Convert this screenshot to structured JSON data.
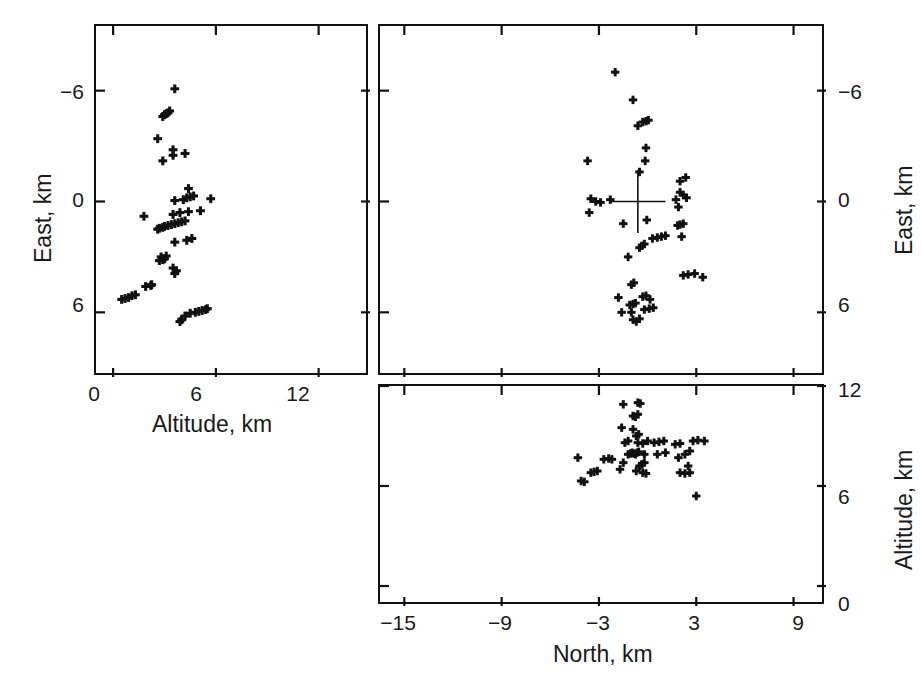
{
  "figure": {
    "background_color": "#ffffff",
    "marker_color": "#111111",
    "axis_color": "#111111"
  },
  "caption": {
    "text": ""
  },
  "chart_data": [
    {
      "id": "east-vs-altitude",
      "type": "scatter",
      "title": "",
      "xlabel": "Altitude, km",
      "ylabel": "East, km",
      "xlim": [
        -1.0,
        15.0
      ],
      "ylim": [
        9.5,
        -9.5
      ],
      "y_inverted": true,
      "xticks": [
        0,
        6,
        12
      ],
      "xticklabels": [
        "0",
        "6",
        "12"
      ],
      "yticks": [
        -6,
        0,
        6
      ],
      "yticklabels": [
        "−6",
        "0",
        "6"
      ],
      "grid": false,
      "legend": "none",
      "marker": "plus",
      "ylabel_side": "left",
      "xlabel_side": "bottom",
      "points": [
        [
          3.9,
          -6.5
        ],
        [
          4.0,
          -6.4
        ],
        [
          4.2,
          -6.2
        ],
        [
          4.5,
          -6.05
        ],
        [
          4.8,
          -6.0
        ],
        [
          5.0,
          -5.95
        ],
        [
          5.2,
          -5.9
        ],
        [
          5.4,
          -5.85
        ],
        [
          5.5,
          -5.8
        ],
        [
          0.5,
          -5.3
        ],
        [
          0.7,
          -5.25
        ],
        [
          0.9,
          -5.2
        ],
        [
          1.1,
          -5.1
        ],
        [
          1.3,
          -5.05
        ],
        [
          1.9,
          -4.6
        ],
        [
          2.2,
          -4.55
        ],
        [
          2.25,
          -4.5
        ],
        [
          3.6,
          -3.9
        ],
        [
          3.7,
          -3.75
        ],
        [
          3.5,
          -3.6
        ],
        [
          2.7,
          -3.2
        ],
        [
          2.9,
          -3.15
        ],
        [
          3.0,
          -3.1
        ],
        [
          2.8,
          -3.0
        ],
        [
          3.1,
          -2.95
        ],
        [
          3.6,
          -2.2
        ],
        [
          4.3,
          -2.1
        ],
        [
          4.6,
          -2.0
        ],
        [
          2.6,
          -1.5
        ],
        [
          2.7,
          -1.45
        ],
        [
          2.9,
          -1.4
        ],
        [
          3.0,
          -1.35
        ],
        [
          3.2,
          -1.3
        ],
        [
          3.4,
          -1.25
        ],
        [
          3.6,
          -1.2
        ],
        [
          3.8,
          -1.15
        ],
        [
          4.0,
          -1.1
        ],
        [
          4.2,
          -1.05
        ],
        [
          1.8,
          -0.8
        ],
        [
          3.5,
          -0.7
        ],
        [
          3.9,
          -0.6
        ],
        [
          4.4,
          -0.55
        ],
        [
          5.1,
          -0.5
        ],
        [
          3.6,
          0.05
        ],
        [
          4.1,
          0.1
        ],
        [
          4.3,
          0.2
        ],
        [
          4.5,
          0.25
        ],
        [
          4.7,
          0.3
        ],
        [
          5.7,
          0.15
        ],
        [
          4.4,
          0.7
        ],
        [
          2.9,
          2.2
        ],
        [
          3.5,
          2.5
        ],
        [
          3.5,
          2.8
        ],
        [
          4.2,
          2.6
        ],
        [
          2.6,
          3.4
        ],
        [
          2.9,
          4.6
        ],
        [
          3.0,
          4.7
        ],
        [
          3.1,
          4.75
        ],
        [
          3.2,
          4.8
        ],
        [
          3.3,
          4.9
        ],
        [
          3.6,
          6.1
        ]
      ]
    },
    {
      "id": "east-vs-north",
      "type": "scatter",
      "title": "",
      "xlabel": "North, km",
      "ylabel": "East, km",
      "xlim": [
        -16.5,
        11.0
      ],
      "ylim": [
        9.5,
        -9.5
      ],
      "y_inverted": true,
      "xticks": [
        -15,
        -9,
        -3,
        3,
        9
      ],
      "xticklabels": [
        "−15",
        "−9",
        "−3",
        "3",
        "9"
      ],
      "yticks": [
        -6,
        0,
        6
      ],
      "yticklabels": [
        "−6",
        "0",
        "6"
      ],
      "grid": false,
      "legend": "none",
      "marker": "plus",
      "ylabel_side": "right",
      "xlabel_side": "none",
      "xticklabels_shown": false,
      "reference_marker": {
        "type": "crosshair",
        "x": -0.6,
        "y": 0.0,
        "size_km": 1.7
      },
      "points": [
        [
          -0.9,
          -6.4
        ],
        [
          -0.7,
          -6.5
        ],
        [
          -0.5,
          -6.35
        ],
        [
          -1.6,
          -6.0
        ],
        [
          -1.0,
          -6.0
        ],
        [
          -0.2,
          -5.85
        ],
        [
          0.1,
          -5.8
        ],
        [
          0.35,
          -5.75
        ],
        [
          -1.1,
          -5.6
        ],
        [
          -0.9,
          -5.55
        ],
        [
          -0.75,
          -5.5
        ],
        [
          -1.8,
          -5.2
        ],
        [
          -0.3,
          -5.15
        ],
        [
          -0.1,
          -5.1
        ],
        [
          0.15,
          -5.3
        ],
        [
          -1.0,
          -4.5
        ],
        [
          -0.85,
          -4.4
        ],
        [
          2.2,
          -4.0
        ],
        [
          2.5,
          -3.95
        ],
        [
          2.9,
          -3.9
        ],
        [
          3.4,
          -4.1
        ],
        [
          -1.2,
          -3.0
        ],
        [
          -0.5,
          -2.5
        ],
        [
          -0.35,
          -2.4
        ],
        [
          -0.2,
          -2.3
        ],
        [
          0.3,
          -2.0
        ],
        [
          0.6,
          -1.95
        ],
        [
          0.85,
          -1.9
        ],
        [
          1.1,
          -1.85
        ],
        [
          2.1,
          -1.9
        ],
        [
          1.85,
          -1.3
        ],
        [
          2.0,
          -1.25
        ],
        [
          2.2,
          -1.2
        ],
        [
          -1.5,
          -1.2
        ],
        [
          -0.05,
          -1.0
        ],
        [
          -3.6,
          -0.6
        ],
        [
          -3.2,
          0.0
        ],
        [
          -3.5,
          0.15
        ],
        [
          -2.9,
          -0.05
        ],
        [
          -2.3,
          0.1
        ],
        [
          1.9,
          -0.3
        ],
        [
          2.4,
          0.2
        ],
        [
          2.2,
          0.35
        ],
        [
          1.75,
          0.1
        ],
        [
          2.0,
          0.5
        ],
        [
          2.0,
          1.1
        ],
        [
          2.35,
          1.3
        ],
        [
          -0.5,
          1.6
        ],
        [
          -3.7,
          2.2
        ],
        [
          -0.15,
          2.2
        ],
        [
          -0.1,
          2.9
        ],
        [
          -0.6,
          4.1
        ],
        [
          -0.3,
          4.3
        ],
        [
          -0.1,
          4.35
        ],
        [
          0.05,
          4.4
        ],
        [
          -0.9,
          5.5
        ],
        [
          -2.0,
          7.0
        ]
      ]
    },
    {
      "id": "altitude-vs-north",
      "type": "scatter",
      "title": "",
      "xlabel": "North, km",
      "ylabel": "Altitude, km",
      "xlim": [
        -16.5,
        11.0
      ],
      "ylim": [
        0,
        13.2
      ],
      "y_inverted": false,
      "xticks": [
        -15,
        -9,
        -3,
        3,
        9
      ],
      "xticklabels": [
        "−15",
        "−9",
        "−3",
        "3",
        "9"
      ],
      "yticks": [
        0,
        6,
        12
      ],
      "yticklabels": [
        "0",
        "6",
        "12"
      ],
      "grid": false,
      "legend": "none",
      "marker": "plus",
      "ylabel_side": "right",
      "xlabel_side": "bottom",
      "points": [
        [
          3.0,
          6.6
        ],
        [
          -4.1,
          5.7
        ],
        [
          -3.9,
          5.75
        ],
        [
          -3.5,
          5.2
        ],
        [
          -3.3,
          5.15
        ],
        [
          -3.1,
          5.1
        ],
        [
          -4.3,
          4.3
        ],
        [
          -1.7,
          5.0
        ],
        [
          -0.7,
          5.1
        ],
        [
          -0.3,
          5.2
        ],
        [
          -0.1,
          5.25
        ],
        [
          -0.5,
          4.8
        ],
        [
          -0.35,
          4.7
        ],
        [
          -0.2,
          4.6
        ],
        [
          2.0,
          5.2
        ],
        [
          2.3,
          5.25
        ],
        [
          2.6,
          5.2
        ],
        [
          2.5,
          4.8
        ],
        [
          -2.7,
          4.4
        ],
        [
          -2.4,
          4.35
        ],
        [
          -2.2,
          4.4
        ],
        [
          -1.5,
          4.6
        ],
        [
          -1.2,
          4.1
        ],
        [
          -1.05,
          4.05
        ],
        [
          -0.95,
          4.0
        ],
        [
          -0.85,
          4.05
        ],
        [
          -0.75,
          4.1
        ],
        [
          -0.65,
          4.0
        ],
        [
          -0.55,
          3.95
        ],
        [
          -0.2,
          4.1
        ],
        [
          0.6,
          4.1
        ],
        [
          1.1,
          4.0
        ],
        [
          1.9,
          4.3
        ],
        [
          2.3,
          4.1
        ],
        [
          2.6,
          3.9
        ],
        [
          -1.4,
          3.4
        ],
        [
          -1.2,
          3.3
        ],
        [
          -0.6,
          3.4
        ],
        [
          -0.3,
          3.45
        ],
        [
          0.0,
          3.3
        ],
        [
          0.4,
          3.4
        ],
        [
          0.7,
          3.35
        ],
        [
          1.0,
          3.3
        ],
        [
          1.7,
          3.5
        ],
        [
          2.0,
          3.45
        ],
        [
          2.8,
          3.3
        ],
        [
          3.1,
          3.25
        ],
        [
          3.5,
          3.3
        ],
        [
          -0.7,
          3.0
        ],
        [
          -0.55,
          2.9
        ],
        [
          -1.6,
          2.5
        ],
        [
          -0.9,
          2.6
        ],
        [
          -0.9,
          1.8
        ],
        [
          -0.75,
          1.85
        ],
        [
          -0.6,
          1.7
        ],
        [
          -1.5,
          1.1
        ],
        [
          -0.6,
          1.0
        ],
        [
          -0.45,
          1.05
        ]
      ]
    }
  ],
  "panels": {
    "left": {
      "name": "East versus Altitude",
      "x_axis_title": "Altitude, km",
      "y_axis_title": "East, km"
    },
    "top_right": {
      "name": "East versus North",
      "y_axis_title": "East, km"
    },
    "bottom_right": {
      "name": "Altitude versus North",
      "x_axis_title": "North, km",
      "y_axis_title": "Altitude, km"
    }
  }
}
